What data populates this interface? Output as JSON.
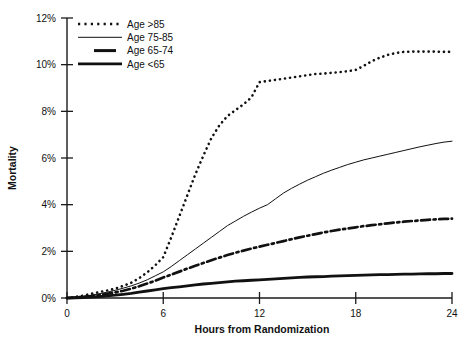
{
  "chart_data": {
    "type": "line",
    "title": "",
    "xlabel": "Hours from Randomization",
    "ylabel": "Mortality",
    "xlim": [
      0,
      24
    ],
    "ylim": [
      0,
      12
    ],
    "grid": false,
    "legend_position": "top-left",
    "xticks": [
      "0",
      "6",
      "12",
      "18",
      "24"
    ],
    "xtick_values": [
      0,
      6,
      12,
      18,
      24
    ],
    "yticks": [
      "0%",
      "2%",
      "4%",
      "6%",
      "8%",
      "10%",
      "12%"
    ],
    "ytick_values": [
      0,
      2,
      4,
      6,
      8,
      10,
      12
    ],
    "y_unit": "%",
    "series": [
      {
        "name": "Age >85",
        "style": "dotted",
        "x": [
          0,
          0.5,
          1,
          1.5,
          2,
          2.5,
          3,
          3.5,
          4,
          4.5,
          5,
          5.5,
          6,
          6.5,
          7,
          7.5,
          8,
          8.5,
          9,
          9.5,
          10,
          10.5,
          11,
          11.5,
          12,
          12.5,
          13,
          13.5,
          14,
          14.5,
          15,
          15.5,
          16,
          16.5,
          17,
          17.5,
          18,
          18.5,
          19,
          19.5,
          20,
          20.5,
          21,
          21.5,
          22,
          22.5,
          23,
          23.5,
          24
        ],
        "values": [
          0.0,
          0.05,
          0.1,
          0.18,
          0.25,
          0.32,
          0.4,
          0.52,
          0.65,
          0.85,
          1.1,
          1.4,
          1.75,
          2.6,
          3.5,
          4.4,
          5.3,
          6.1,
          6.85,
          7.4,
          7.8,
          8.05,
          8.3,
          8.6,
          9.25,
          9.3,
          9.35,
          9.4,
          9.45,
          9.5,
          9.55,
          9.6,
          9.62,
          9.65,
          9.68,
          9.72,
          9.78,
          9.95,
          10.15,
          10.3,
          10.42,
          10.5,
          10.55,
          10.56,
          10.56,
          10.56,
          10.56,
          10.55,
          10.55
        ]
      },
      {
        "name": "Age 75-85",
        "style": "thin-solid",
        "x": [
          0,
          0.5,
          1,
          1.5,
          2,
          2.5,
          3,
          3.5,
          4,
          4.5,
          5,
          5.5,
          6,
          6.5,
          7,
          7.5,
          8,
          8.5,
          9,
          9.5,
          10,
          10.5,
          11,
          11.5,
          12,
          12.5,
          13,
          13.5,
          14,
          14.5,
          15,
          15.5,
          16,
          16.5,
          17,
          17.5,
          18,
          18.5,
          19,
          19.5,
          20,
          20.5,
          21,
          21.5,
          22,
          22.5,
          23,
          23.5,
          24
        ],
        "values": [
          0.0,
          0.03,
          0.07,
          0.12,
          0.18,
          0.25,
          0.33,
          0.42,
          0.52,
          0.64,
          0.78,
          0.95,
          1.12,
          1.35,
          1.6,
          1.85,
          2.1,
          2.35,
          2.6,
          2.85,
          3.1,
          3.3,
          3.5,
          3.68,
          3.85,
          4.0,
          4.25,
          4.5,
          4.7,
          4.88,
          5.05,
          5.2,
          5.35,
          5.48,
          5.6,
          5.72,
          5.82,
          5.92,
          6.0,
          6.08,
          6.16,
          6.24,
          6.32,
          6.4,
          6.48,
          6.55,
          6.62,
          6.68,
          6.72
        ]
      },
      {
        "name": "Age 65-74",
        "style": "dash-dot",
        "x": [
          0,
          0.5,
          1,
          1.5,
          2,
          2.5,
          3,
          3.5,
          4,
          4.5,
          5,
          5.5,
          6,
          6.5,
          7,
          7.5,
          8,
          8.5,
          9,
          9.5,
          10,
          10.5,
          11,
          11.5,
          12,
          12.5,
          13,
          13.5,
          14,
          14.5,
          15,
          15.5,
          16,
          16.5,
          17,
          17.5,
          18,
          18.5,
          19,
          19.5,
          20,
          20.5,
          21,
          21.5,
          22,
          22.5,
          23,
          23.5,
          24
        ],
        "values": [
          0.0,
          0.02,
          0.05,
          0.08,
          0.13,
          0.18,
          0.24,
          0.31,
          0.4,
          0.5,
          0.62,
          0.74,
          0.88,
          1.0,
          1.13,
          1.26,
          1.38,
          1.5,
          1.62,
          1.73,
          1.84,
          1.94,
          2.03,
          2.12,
          2.2,
          2.28,
          2.36,
          2.44,
          2.52,
          2.6,
          2.67,
          2.74,
          2.81,
          2.87,
          2.93,
          2.98,
          3.03,
          3.08,
          3.12,
          3.16,
          3.2,
          3.24,
          3.27,
          3.3,
          3.32,
          3.35,
          3.37,
          3.39,
          3.4
        ]
      },
      {
        "name": "Age <65",
        "style": "thick-solid",
        "x": [
          0,
          0.5,
          1,
          1.5,
          2,
          2.5,
          3,
          3.5,
          4,
          4.5,
          5,
          5.5,
          6,
          6.5,
          7,
          7.5,
          8,
          8.5,
          9,
          9.5,
          10,
          10.5,
          11,
          11.5,
          12,
          12.5,
          13,
          13.5,
          14,
          14.5,
          15,
          15.5,
          16,
          16.5,
          17,
          17.5,
          18,
          18.5,
          19,
          19.5,
          20,
          20.5,
          21,
          21.5,
          22,
          22.5,
          23,
          23.5,
          24
        ],
        "values": [
          0.0,
          0.01,
          0.02,
          0.04,
          0.06,
          0.09,
          0.12,
          0.16,
          0.2,
          0.25,
          0.3,
          0.35,
          0.4,
          0.44,
          0.48,
          0.52,
          0.56,
          0.6,
          0.63,
          0.66,
          0.69,
          0.72,
          0.74,
          0.76,
          0.78,
          0.8,
          0.82,
          0.84,
          0.86,
          0.88,
          0.9,
          0.91,
          0.92,
          0.94,
          0.95,
          0.96,
          0.97,
          0.98,
          0.99,
          1.0,
          1.0,
          1.01,
          1.02,
          1.02,
          1.03,
          1.04,
          1.04,
          1.05,
          1.05
        ]
      }
    ]
  },
  "legend": {
    "items": [
      {
        "label": "Age >85"
      },
      {
        "label": "Age 75-85"
      },
      {
        "label": "Age 65-74"
      },
      {
        "label": "Age <65"
      }
    ]
  },
  "axes": {
    "y_title": "Mortality",
    "x_title": "Hours from Randomization"
  }
}
